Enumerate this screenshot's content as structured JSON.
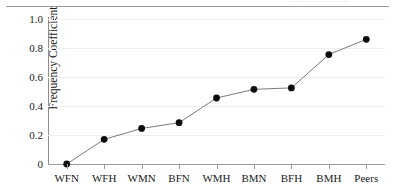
{
  "figure": {
    "cropped_caption_remnant": "………   …………",
    "y_axis_title": "Frequency Coefficient"
  },
  "chart_data": {
    "type": "line",
    "title": "",
    "xlabel": "",
    "ylabel": "Frequency Coefficient",
    "ylim": [
      0,
      1.0
    ],
    "grid": true,
    "legend": "none",
    "marker": "filled-circle",
    "categories": [
      "WFN",
      "WFH",
      "WMN",
      "BFN",
      "WMH",
      "BMN",
      "BFH",
      "BMH",
      "Peers"
    ],
    "values": [
      0.0,
      0.17,
      0.245,
      0.285,
      0.455,
      0.515,
      0.525,
      0.755,
      0.86
    ],
    "ytick_labels": [
      "1.0",
      "0.8",
      "0.6",
      "0.4",
      "0.2",
      "0"
    ],
    "ytick_values": [
      1.0,
      0.8,
      0.6,
      0.4,
      0.2,
      0.0
    ]
  }
}
